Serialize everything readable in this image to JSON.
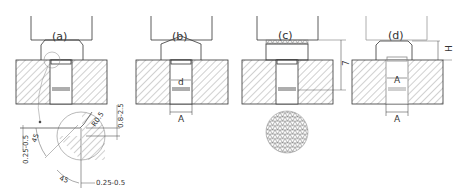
{
  "diagram": {
    "type": "technical-drawing",
    "stroke_color": "#333333",
    "hatch_color": "#666666",
    "panels": [
      {
        "id": "a",
        "label": "(a)",
        "features": [
          "punch",
          "workpiece",
          "die-with-hatch",
          "detail-circle-callout"
        ]
      },
      {
        "id": "b",
        "label": "(b)",
        "features": [
          "punch-with-conical-top",
          "die-with-hatch",
          "dim-d",
          "dim-A"
        ]
      },
      {
        "id": "c",
        "label": "(c)",
        "features": [
          "punch-with-knurled-contact",
          "die-with-hatch",
          "dim-7",
          "knurl-detail-circle"
        ]
      },
      {
        "id": "d",
        "label": "(d)",
        "features": [
          "punch",
          "die-with-hatch",
          "dim-H",
          "dim-A-inner",
          "dim-A-outer"
        ]
      }
    ],
    "dimensions": {
      "b_inner": "d",
      "b_outer": "A",
      "c_height": "7",
      "d_height": "H",
      "d_inner": "A",
      "d_outer": "A"
    },
    "detail_a": {
      "radius": "R0.5",
      "chamfer": "0.8-2.5",
      "left_offset": "0.25-0.5",
      "bottom_offset": "0.25-0.5",
      "angle_small": "45",
      "angle_large": "45"
    }
  }
}
